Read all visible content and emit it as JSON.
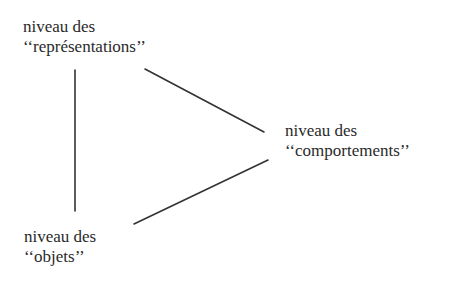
{
  "diagram": {
    "nodes": [
      {
        "id": "representations",
        "line1": "niveau des",
        "line2": "‘‘représentations’’"
      },
      {
        "id": "comportements",
        "line1": "niveau des",
        "line2": "‘‘comportements’’"
      },
      {
        "id": "objets",
        "line1": "niveau des",
        "line2": "‘‘objets’’"
      }
    ],
    "edges": [
      {
        "from": "representations",
        "to": "objets"
      },
      {
        "from": "representations",
        "to": "comportements"
      },
      {
        "from": "objets",
        "to": "comportements"
      }
    ],
    "colors": {
      "line": "#333333",
      "text": "#2a2a2a",
      "background": "#ffffff"
    }
  }
}
